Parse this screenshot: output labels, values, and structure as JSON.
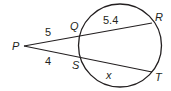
{
  "diagram": {
    "type": "two-secants-circle",
    "stroke_color": "#231f20",
    "background": "#ffffff",
    "circle": {
      "cx": 120,
      "cy": 45.5,
      "r": 41.5
    },
    "points": {
      "P": {
        "label": "P",
        "x": 24,
        "y": 46
      },
      "Q": {
        "label": "Q",
        "x": 80,
        "y": 34
      },
      "R": {
        "label": "R",
        "x": 152,
        "y": 23
      },
      "S": {
        "label": "S",
        "x": 80,
        "y": 57
      },
      "T": {
        "label": "T",
        "x": 152,
        "y": 72
      }
    },
    "segment_labels": {
      "PQ": "5",
      "QR": "5.4",
      "PS": "4",
      "ST": "x"
    }
  }
}
